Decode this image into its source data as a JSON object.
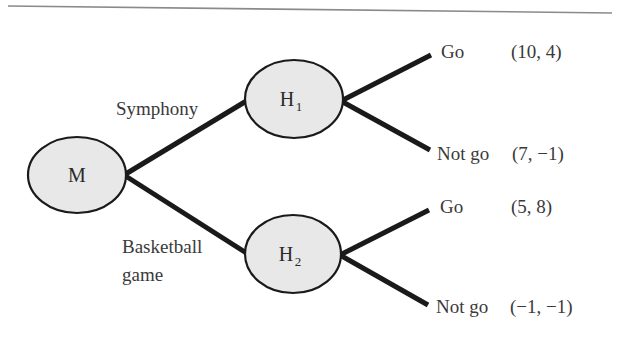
{
  "diagram": {
    "type": "game-tree",
    "root": {
      "id": "M",
      "label": "M"
    },
    "first_moves": [
      {
        "label_lines": [
          "Symphony"
        ],
        "node": {
          "id": "H1",
          "label": "H",
          "subscript": "1"
        },
        "outcomes": [
          {
            "action": "Go",
            "payoff": "(10, 4)"
          },
          {
            "action": "Not go",
            "payoff": "(7, −1)"
          }
        ]
      },
      {
        "label_lines": [
          "Basketball",
          "game"
        ],
        "node": {
          "id": "H2",
          "label": "H",
          "subscript": "2"
        },
        "outcomes": [
          {
            "action": "Go",
            "payoff": "(5, 8)"
          },
          {
            "action": "Not go",
            "payoff": "(−1, −1)"
          }
        ]
      }
    ],
    "colors": {
      "node_fill": "#e8e8e8",
      "stroke": "#1a1a1a",
      "text": "#3a3a3a",
      "rule": "#8a8a8a"
    }
  }
}
